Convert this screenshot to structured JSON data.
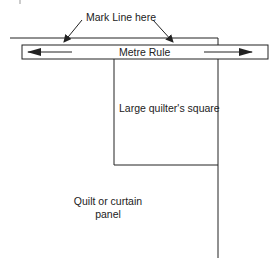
{
  "diagram": {
    "type": "instructional-illustration",
    "labels": {
      "mark_line": "Mark Line here",
      "ruler": "Metre Rule",
      "square": "Large quilter's square",
      "panel_line1": "Quilt or curtain",
      "panel_line2": "panel"
    },
    "colors": {
      "line": "#222222",
      "background": "#ffffff"
    },
    "elements": [
      {
        "name": "top-mark-line",
        "kind": "line"
      },
      {
        "name": "metre-rule",
        "kind": "rectangle",
        "arrows": [
          "left",
          "right"
        ]
      },
      {
        "name": "quilters-square",
        "kind": "rectangle"
      },
      {
        "name": "panel-edge",
        "kind": "line"
      },
      {
        "name": "mark-pointer-arrows",
        "kind": "arrow",
        "count": 2
      }
    ]
  }
}
